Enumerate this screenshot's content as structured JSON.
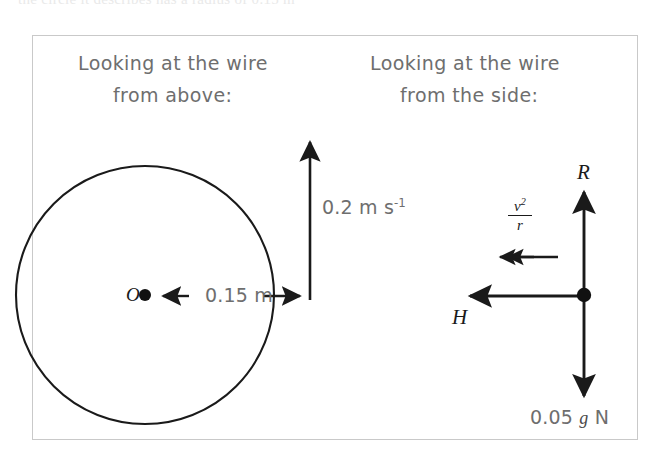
{
  "scan": {
    "top_cut_text": "the circle it describes has a radius of 0.15 m"
  },
  "figure": {
    "left_panel": {
      "caption_line1": "Looking at the wire",
      "caption_line2": "from above:",
      "centre_symbol": "O",
      "radius_label": "0.15 m",
      "speed_label_value": "0.2 m s",
      "speed_label_exponent": "-1",
      "circle": {
        "centre_x": 145,
        "centre_y": 295,
        "radius": 129
      },
      "velocity_arrow": {
        "x": 310,
        "from_y": 296,
        "to_y": 133,
        "direction": "up"
      }
    },
    "right_panel": {
      "caption_line1": "Looking at the wire",
      "caption_line2": "from the side:",
      "normal_reaction_symbol": "R",
      "horizontal_force_symbol": "H",
      "weight_value": "0.05",
      "weight_g": "g",
      "weight_unit": "N",
      "acceleration_numerator": "v",
      "acceleration_numerator_exponent": "2",
      "acceleration_denominator": "r",
      "junction": {
        "x": 584,
        "y": 295
      },
      "up_arrow": {
        "from_y": 295,
        "to_y": 185
      },
      "down_arrow": {
        "from_y": 295,
        "to_y": 400
      },
      "left_arrow": {
        "from_x": 584,
        "to_x": 463
      },
      "acceleration_arrow": {
        "from_x": 558,
        "to_x": 494,
        "y": 257
      }
    }
  },
  "style": {
    "ink_colour": "#1a1a1a",
    "text_colour": "#6e6e6e",
    "frame_colour": "#c9c9c9",
    "background_colour": "#ffffff"
  }
}
